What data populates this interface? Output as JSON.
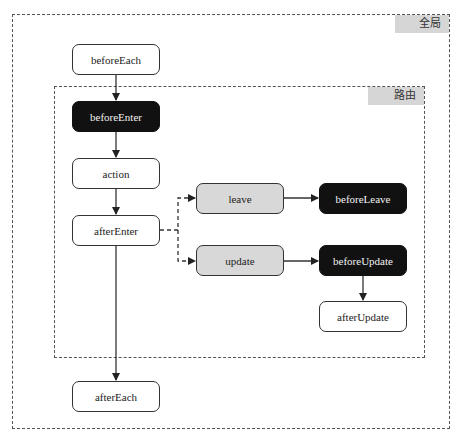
{
  "scopes": {
    "global": {
      "label": "全局"
    },
    "route": {
      "label": "路由"
    }
  },
  "nodes": {
    "beforeEach": {
      "label": "beforeEach",
      "style": "white"
    },
    "beforeEnter": {
      "label": "beforeEnter",
      "style": "dark"
    },
    "action": {
      "label": "action",
      "style": "white"
    },
    "afterEnter": {
      "label": "afterEnter",
      "style": "white"
    },
    "leave": {
      "label": "leave",
      "style": "gray"
    },
    "beforeLeave": {
      "label": "beforeLeave",
      "style": "dark"
    },
    "update": {
      "label": "update",
      "style": "gray"
    },
    "beforeUpdate": {
      "label": "beforeUpdate",
      "style": "dark"
    },
    "afterUpdate": {
      "label": "afterUpdate",
      "style": "white"
    },
    "afterEach": {
      "label": "afterEach",
      "style": "white"
    }
  },
  "edges": [
    {
      "from": "beforeEach",
      "to": "beforeEnter",
      "style": "solid"
    },
    {
      "from": "beforeEnter",
      "to": "action",
      "style": "solid"
    },
    {
      "from": "action",
      "to": "afterEnter",
      "style": "solid"
    },
    {
      "from": "afterEnter",
      "to": "leave",
      "style": "dashed"
    },
    {
      "from": "afterEnter",
      "to": "update",
      "style": "dashed"
    },
    {
      "from": "leave",
      "to": "beforeLeave",
      "style": "solid"
    },
    {
      "from": "update",
      "to": "beforeUpdate",
      "style": "solid"
    },
    {
      "from": "beforeUpdate",
      "to": "afterUpdate",
      "style": "solid"
    },
    {
      "from": "afterEnter",
      "to": "afterEach",
      "style": "solid"
    }
  ],
  "colors": {
    "dark_node": "#111111",
    "gray_node": "#d8d8d8",
    "scope_label_bg": "#d6d6d6",
    "line": "#333333"
  }
}
